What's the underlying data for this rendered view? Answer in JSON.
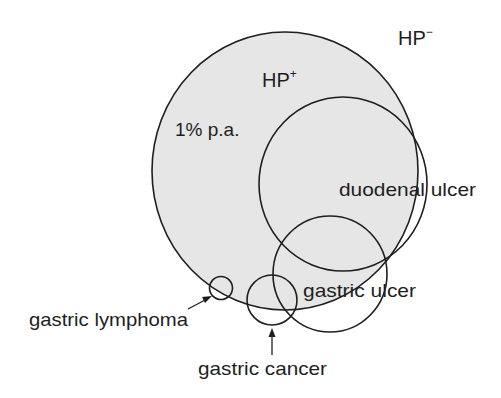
{
  "diagram": {
    "title": "",
    "colors": {
      "fill": "#e6e6e6",
      "stroke": "#1e1e1e",
      "background": "#ffffff"
    },
    "regions": {
      "hp_positive": {
        "label": "HP",
        "sup": "+",
        "rate_label": "1% p.a."
      },
      "hp_negative": {
        "label": "HP",
        "sup": "−"
      }
    },
    "circles": [
      {
        "id": "hp-positive-population",
        "cx": 285,
        "cy": 171,
        "rx": 133,
        "ry": 139
      },
      {
        "id": "duodenal-ulcer",
        "cx": 343,
        "cy": 184,
        "rx": 84,
        "ry": 87
      },
      {
        "id": "gastric-ulcer",
        "cx": 330,
        "cy": 274,
        "rx": 57,
        "ry": 58
      },
      {
        "id": "gastric-cancer",
        "cx": 272,
        "cy": 300,
        "rx": 25,
        "ry": 25
      },
      {
        "id": "gastric-lymphoma",
        "cx": 221,
        "cy": 288,
        "rx": 11,
        "ry": 11
      }
    ],
    "labels": {
      "hp_minus": "HP",
      "hp_minus_sup": "−",
      "hp_plus": "HP",
      "hp_plus_sup": "+",
      "rate": "1% p.a.",
      "duodenal_ulcer": "duodenal ulcer",
      "gastric_ulcer": "gastric ulcer",
      "gastric_lymphoma": "gastric lymphoma",
      "gastric_cancer": "gastric cancer"
    }
  }
}
